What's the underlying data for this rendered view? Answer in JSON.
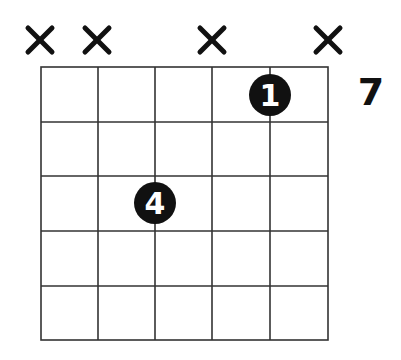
{
  "chord_diagram": {
    "strings": 6,
    "frets_shown": 5,
    "base_fret_label": "7",
    "string_markers": [
      {
        "string": 1,
        "marker": "x"
      },
      {
        "string": 2,
        "marker": "x"
      },
      {
        "string": 3,
        "marker": ""
      },
      {
        "string": 4,
        "marker": "x"
      },
      {
        "string": 5,
        "marker": ""
      },
      {
        "string": 6,
        "marker": "x"
      }
    ],
    "fingers": [
      {
        "string": 5,
        "fret": 1,
        "finger": "1"
      },
      {
        "string": 3,
        "fret": 3,
        "finger": "4"
      }
    ],
    "colors": {
      "line": "#333333",
      "dot": "#111111",
      "dot_text": "#ffffff",
      "mute": "#111111"
    }
  }
}
